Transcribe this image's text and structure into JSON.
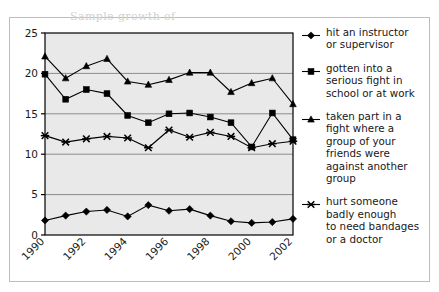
{
  "figure": {
    "clipped_top_text": "Sample growth of",
    "plot_background": "#e9e9e9",
    "frame_color": "#bdbdbd",
    "axis_color": "#000000",
    "gridline_color": "#8c8c8c",
    "series_color": "#000000"
  },
  "legend": {
    "entries": [
      {
        "marker": "diamond-marker",
        "label": "hit an instructor\nor supervisor"
      },
      {
        "marker": "square-marker",
        "label": "gotten into a\nserious fight in\nschool or at work"
      },
      {
        "marker": "triangle-marker",
        "label": "taken part in a\nfight where a\ngroup of your\nfriends were\nagainst another\ngroup"
      },
      {
        "marker": "x-marker",
        "label": "hurt someone\nbadly enough\nto need bandages\nor a doctor"
      }
    ]
  },
  "chart_data": {
    "type": "line",
    "title": "",
    "xlabel": "",
    "ylabel": "",
    "x": [
      1990,
      1991,
      1992,
      1993,
      1994,
      1995,
      1996,
      1997,
      1998,
      1999,
      2000,
      2001,
      2002
    ],
    "x_tick_labels": [
      "1990",
      "1992",
      "1994",
      "1996",
      "1998",
      "2000",
      "2002"
    ],
    "x_tick_values": [
      1990,
      1992,
      1994,
      1996,
      1998,
      2000,
      2002
    ],
    "y_tick_labels": [
      "0",
      "5",
      "10",
      "15",
      "20",
      "25"
    ],
    "y_tick_values": [
      0,
      5,
      10,
      15,
      20,
      25
    ],
    "ylim": [
      0,
      25
    ],
    "xlim": [
      1990,
      2002
    ],
    "grid": "horizontal",
    "legend_position": "right",
    "series": [
      {
        "name": "hit an instructor or supervisor",
        "marker": "diamond",
        "values": [
          1.8,
          2.4,
          2.9,
          3.1,
          2.3,
          3.7,
          3.0,
          3.2,
          2.4,
          1.7,
          1.5,
          1.6,
          2.0
        ]
      },
      {
        "name": "gotten into a serious fight in school or at work",
        "marker": "square",
        "values": [
          19.9,
          16.8,
          18.0,
          17.5,
          14.8,
          13.9,
          15.0,
          15.1,
          14.6,
          13.9,
          10.9,
          15.1,
          11.8
        ]
      },
      {
        "name": "taken part in a fight where a group of your friends were against another group",
        "marker": "triangle",
        "values": [
          22.1,
          19.4,
          20.9,
          21.8,
          19.0,
          18.6,
          19.2,
          20.1,
          20.1,
          17.7,
          18.8,
          19.4,
          16.2
        ]
      },
      {
        "name": "hurt someone badly enough to need bandages or a doctor",
        "marker": "x",
        "values": [
          12.3,
          11.5,
          11.9,
          12.2,
          12.0,
          10.8,
          13.0,
          12.1,
          12.7,
          12.2,
          10.8,
          11.3,
          11.6
        ]
      }
    ]
  }
}
